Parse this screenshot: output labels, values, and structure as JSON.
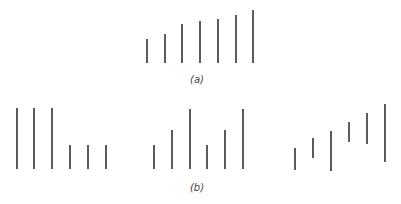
{
  "diagram": {
    "stroke_color": "#333333",
    "stroke_width": 1.6,
    "panel_a": {
      "label": "(a)",
      "label_pos": [
        197,
        74
      ],
      "lines": [
        {
          "x": 147,
          "y1": 39,
          "y2": 63
        },
        {
          "x": 165,
          "y1": 34,
          "y2": 63
        },
        {
          "x": 182,
          "y1": 24,
          "y2": 63
        },
        {
          "x": 200,
          "y1": 21,
          "y2": 63
        },
        {
          "x": 218,
          "y1": 19,
          "y2": 63
        },
        {
          "x": 236,
          "y1": 15,
          "y2": 63
        },
        {
          "x": 253,
          "y1": 10,
          "y2": 63
        }
      ]
    },
    "panel_b": {
      "label": "(b)",
      "label_pos": [
        197,
        182
      ],
      "groups": [
        {
          "lines": [
            {
              "x": 17,
              "y1": 108,
              "y2": 169
            },
            {
              "x": 34,
              "y1": 108,
              "y2": 169
            },
            {
              "x": 52,
              "y1": 108,
              "y2": 169
            },
            {
              "x": 70,
              "y1": 145,
              "y2": 169
            },
            {
              "x": 88,
              "y1": 145,
              "y2": 169
            },
            {
              "x": 106,
              "y1": 145,
              "y2": 169
            }
          ]
        },
        {
          "lines": [
            {
              "x": 154,
              "y1": 145,
              "y2": 169
            },
            {
              "x": 172,
              "y1": 130,
              "y2": 169
            },
            {
              "x": 190,
              "y1": 109,
              "y2": 169
            },
            {
              "x": 207,
              "y1": 145,
              "y2": 169
            },
            {
              "x": 225,
              "y1": 130,
              "y2": 169
            },
            {
              "x": 243,
              "y1": 109,
              "y2": 169
            }
          ]
        },
        {
          "lines": [
            {
              "x": 295,
              "y1": 148,
              "y2": 170
            },
            {
              "x": 313,
              "y1": 138,
              "y2": 158
            },
            {
              "x": 331,
              "y1": 131,
              "y2": 171
            },
            {
              "x": 349,
              "y1": 122,
              "y2": 142
            },
            {
              "x": 367,
              "y1": 113,
              "y2": 144
            },
            {
              "x": 385,
              "y1": 104,
              "y2": 162
            }
          ]
        }
      ]
    }
  }
}
